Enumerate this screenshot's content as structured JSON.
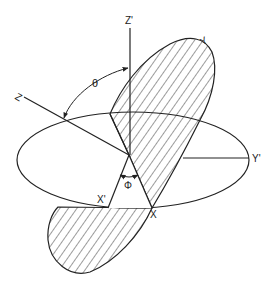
{
  "diagram": {
    "type": "rotated-coordinate-frames",
    "labels": {
      "z": "Z",
      "z_prime": "Z'",
      "y": "Y",
      "y_prime": "Y'",
      "x": "X",
      "x_prime": "X'",
      "theta": "θ",
      "phi": "Φ"
    },
    "colors": {
      "stroke": "#222222",
      "background": "#ffffff",
      "hatch": "#222222"
    }
  }
}
